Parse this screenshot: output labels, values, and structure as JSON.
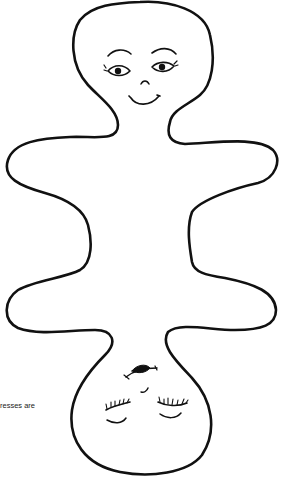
{
  "figure": {
    "caption_fragment": "resses are",
    "stroke_color": "#111111",
    "background_color": "#ffffff"
  },
  "faces": [
    {
      "name": "upper-face",
      "expression": "smiling",
      "eyes": "open"
    },
    {
      "name": "lower-face",
      "expression": "sleeping",
      "eyes": "closed",
      "orientation": "upside-down"
    }
  ]
}
